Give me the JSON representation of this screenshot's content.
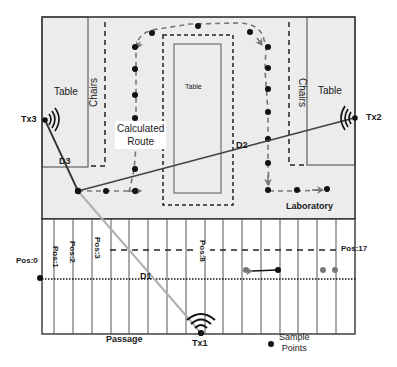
{
  "diagram": {
    "room": {
      "name": "Laboratory",
      "tables": [
        {
          "label": "Table",
          "position": "left"
        },
        {
          "label": "Table",
          "position": "center"
        },
        {
          "label": "Table",
          "position": "right"
        }
      ],
      "chairs": [
        {
          "label": "Chairs",
          "position": "left"
        },
        {
          "label": "Chairs",
          "position": "right"
        }
      ],
      "route_label_line1": "Calculated",
      "route_label_line2": "Route"
    },
    "passage": {
      "name": "Passage",
      "positions": [
        {
          "label": "Pos:0"
        },
        {
          "label": "Pos:1"
        },
        {
          "label": "Pos:2"
        },
        {
          "label": "Pos:3"
        },
        {
          "label": "Pos:8"
        },
        {
          "label": "Pos:17"
        }
      ]
    },
    "transmitters": [
      {
        "label": "Tx1",
        "location": "passage-bottom"
      },
      {
        "label": "Tx2",
        "location": "laboratory-right-wall"
      },
      {
        "label": "Tx3",
        "location": "laboratory-left-wall"
      }
    ],
    "distances": [
      {
        "label": "D1",
        "from": "Tx1"
      },
      {
        "label": "D2",
        "from": "Tx2"
      },
      {
        "label": "D3",
        "from": "Tx3"
      }
    ],
    "legend": {
      "sample_points_line1": "Sample",
      "sample_points_line2": "Points"
    },
    "colors": {
      "room_fill": "#ececec",
      "line": "#333333",
      "d1_line": "#b0b0b0",
      "route": "#777777",
      "point": "#111111",
      "point_gray": "#777777"
    }
  }
}
